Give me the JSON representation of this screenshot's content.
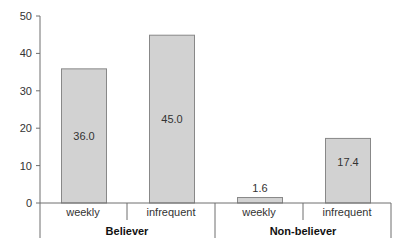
{
  "chart_data": {
    "type": "bar",
    "title": "",
    "xlabel": "",
    "ylabel": "",
    "ylim": [
      0,
      50
    ],
    "yticks": [
      0,
      10,
      20,
      30,
      40,
      50
    ],
    "grid": false,
    "legend": null,
    "groups": [
      {
        "label": "Believer",
        "categories": [
          "weekly",
          "infrequent"
        ],
        "values": [
          36.0,
          45.0
        ]
      },
      {
        "label": "Non-believer",
        "categories": [
          "weekly",
          "infrequent"
        ],
        "values": [
          1.6,
          17.4
        ]
      }
    ],
    "categories": [
      "weekly",
      "infrequent",
      "weekly",
      "infrequent"
    ],
    "values": [
      36.0,
      45.0,
      1.6,
      17.4
    ],
    "data_labels": [
      "36.0",
      "45.0",
      "1.6",
      "17.4"
    ],
    "colors": {
      "bar_fill": "#d2d2d2",
      "bar_stroke": "#888888",
      "axis": "#6e6e6e",
      "text": "#333333"
    }
  }
}
